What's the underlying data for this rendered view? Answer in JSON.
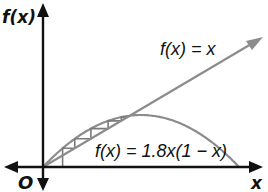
{
  "diagram": {
    "labels": {
      "y_axis": "f(x)",
      "x_axis": "x",
      "origin": "O",
      "line": "f(x) = x",
      "curve": "f(x) = 1.8x(1 − x)"
    },
    "colors": {
      "axes": "#111111",
      "curve": "#8c8c8c",
      "line": "#8c8c8c",
      "cobweb": "#7a7a7a",
      "text": "#111111"
    },
    "model": {
      "r": 1.8,
      "x0": 0.1,
      "iterations": 8,
      "fixed_point": 0.444
    }
  }
}
